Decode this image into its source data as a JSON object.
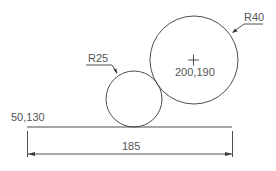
{
  "drawing": {
    "type": "cad-dimension-sketch",
    "line_color": "#3a3a3a",
    "text_color": "#555555",
    "baseline": {
      "start_label": "50,130",
      "start_px": [
        27,
        127
      ],
      "end_px": [
        232,
        127
      ]
    },
    "small_circle": {
      "label": "R25",
      "center_px": [
        134,
        99
      ],
      "radius_px": 28
    },
    "large_circle": {
      "label": "R40",
      "center_label": "200,190",
      "center_px": [
        194,
        60
      ],
      "radius_px": 44
    },
    "dimension": {
      "label": "185",
      "y_px": 154,
      "from_x_px": 27,
      "to_x_px": 232
    }
  }
}
